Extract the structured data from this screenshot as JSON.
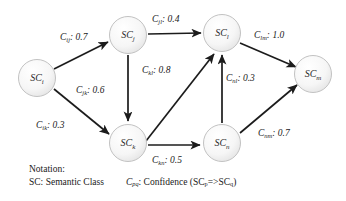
{
  "figure": {
    "type": "directed-graph",
    "nodes": [
      {
        "id": "i",
        "label": "SC",
        "sub": "i",
        "cx": 37,
        "cy": 78
      },
      {
        "id": "j",
        "label": "SC",
        "sub": "j",
        "cx": 128,
        "cy": 35
      },
      {
        "id": "k",
        "label": "SC",
        "sub": "k",
        "cx": 128,
        "cy": 143
      },
      {
        "id": "l",
        "label": "SC",
        "sub": "l",
        "cx": 222,
        "cy": 33
      },
      {
        "id": "n",
        "label": "SC",
        "sub": "n",
        "cx": 222,
        "cy": 143
      },
      {
        "id": "m",
        "label": "SC",
        "sub": "m",
        "cx": 313,
        "cy": 74
      }
    ],
    "edges": [
      {
        "from": "i",
        "to": "j",
        "sym": "C",
        "sub": "ij",
        "value": "0.7",
        "lx": 60,
        "ly": 40
      },
      {
        "from": "i",
        "to": "k",
        "sym": "C",
        "sub": "ik",
        "value": "0.3",
        "lx": 36,
        "ly": 128
      },
      {
        "from": "j",
        "to": "l",
        "sym": "C",
        "sub": "jl",
        "value": "0.4",
        "lx": 152,
        "ly": 22
      },
      {
        "from": "j",
        "to": "k",
        "sym": "C",
        "sub": "jk",
        "value": "0.6",
        "lx": 76,
        "ly": 93
      },
      {
        "from": "k",
        "to": "l",
        "sym": "C",
        "sub": "kl",
        "value": "0.8",
        "lx": 142,
        "ly": 73
      },
      {
        "from": "k",
        "to": "n",
        "sym": "C",
        "sub": "kn",
        "value": "0.5",
        "lx": 152,
        "ly": 163
      },
      {
        "from": "n",
        "to": "l",
        "sym": "C",
        "sub": "nl",
        "value": "0.3",
        "lx": 226,
        "ly": 81
      },
      {
        "from": "l",
        "to": "m",
        "sym": "C",
        "sub": "lm",
        "value": "1.0",
        "lx": 254,
        "ly": 38
      },
      {
        "from": "n",
        "to": "m",
        "sym": "C",
        "sub": "nm",
        "value": "0.7",
        "lx": 258,
        "ly": 136
      }
    ]
  },
  "notation": {
    "heading": "Notation:",
    "sc_text": "SC: Semantic Class",
    "conf_symbol": "C",
    "conf_symbol_sub": "pq",
    "conf_text": ": Confidence (SC",
    "conf_sub_p": "p",
    "conf_arrow": "=>SC",
    "conf_sub_q": "q",
    "conf_close": ")"
  },
  "colors": {
    "node_fill": "#f2f2f2",
    "node_stroke": "#c8c8c8",
    "edge": "#1c1c1c",
    "text": "#1a1a1a"
  }
}
